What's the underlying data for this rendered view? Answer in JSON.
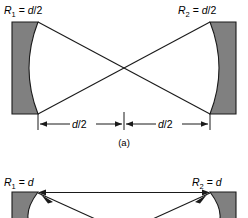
{
  "figure": {
    "colors": {
      "mirror_fill": "#808080",
      "stroke": "#1a1a1a",
      "background": "#ffffff"
    },
    "panels": [
      {
        "id": "a",
        "caption": "(a)",
        "left_mirror": {
          "label_symbol": "R",
          "label_subscript": "1",
          "label_equals": "=",
          "label_value": "d/2",
          "label_full": "R1 = d/2"
        },
        "right_mirror": {
          "label_symbol": "R",
          "label_subscript": "2",
          "label_equals": "=",
          "label_value": "d/2",
          "label_full": "R2 = d/2"
        },
        "dimensions": [
          {
            "label": "d/2",
            "side": "left"
          },
          {
            "label": "d/2",
            "side": "right"
          }
        ],
        "ray_description": "two crossing rays forming an X between mirror edges"
      },
      {
        "id": "b",
        "caption": "",
        "left_mirror": {
          "label_symbol": "R",
          "label_subscript": "1",
          "label_equals": "=",
          "label_value": "d",
          "label_full": "R1 = d"
        },
        "right_mirror": {
          "label_symbol": "R",
          "label_subscript": "2",
          "label_equals": "=",
          "label_value": "d",
          "label_full": "R2 = d"
        },
        "dimensions": [],
        "ray_description": "horizontal ray with arrowheads at both mirror tips plus diagonal rays"
      }
    ]
  }
}
